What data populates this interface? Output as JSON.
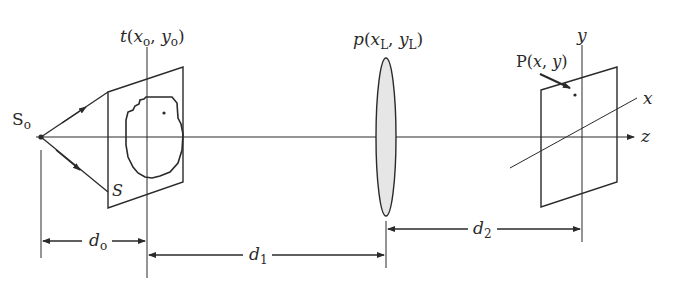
{
  "diagram": {
    "type": "optical-system-schematic",
    "labels": {
      "source": {
        "main": "S",
        "sub": "o"
      },
      "object_function": {
        "fn": "t",
        "open": "(",
        "x": "x",
        "xsub": "o",
        "comma": ", ",
        "y": "y",
        "ysub": "o",
        "close": ")"
      },
      "lens_function": {
        "fn": "p",
        "open": "(",
        "x": "x",
        "xsub": "L",
        "comma": ", ",
        "y": "y",
        "ysub": "L",
        "close": ")"
      },
      "observation_point": {
        "text": "P(",
        "x": "x",
        "comma": ", ",
        "y": "y",
        "close": ")"
      },
      "secondary_source": "S",
      "axis_y": "y",
      "axis_x": "x",
      "axis_z": "z",
      "distance_object": {
        "main": "d",
        "sub": "o"
      },
      "distance_1": {
        "main": "d",
        "sub": "1"
      },
      "distance_2": {
        "main": "d",
        "sub": "2"
      }
    },
    "colors": {
      "line": "#2a2a2a",
      "lens_fill": "#e6e6e6",
      "background": "#ffffff"
    }
  }
}
